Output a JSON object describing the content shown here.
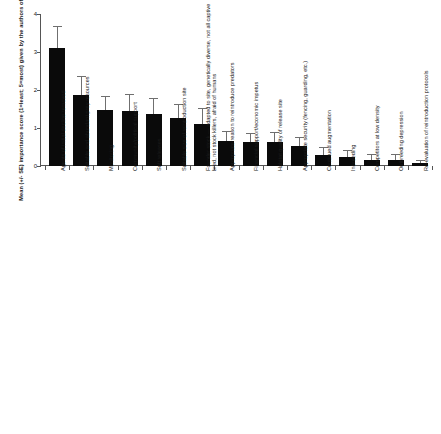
{
  "chart_data": {
    "type": "bar",
    "title": "",
    "xlabel": "",
    "ylabel": "Mean (+/- SE) importance score (1=least; 5=most) given by the authors of this book",
    "ylim": [
      0,
      4
    ],
    "yticks": [
      0,
      1,
      2,
      3,
      4
    ],
    "ytick_labels": [
      "0",
      "1",
      "2",
      "3",
      "4"
    ],
    "grid": false,
    "legend": "none",
    "error_type": "SE",
    "categories": [
      "Agents of initial decline removed",
      "Suitable and abundant prey resources",
      "Monitoring",
      "Community/political support",
      "Soft releases",
      "Suitable size of reintroduction site",
      "Founder stock — adapted to site, genetically diverse, not all captive bred, not stock killers, afraid of humans",
      "Appropriate reason to reintroduce predators",
      "Financial support/economic impetus",
      "Habitat quality of release site",
      "Appropriate security (fencing, guarding, etc.)",
      "Continued augmentation",
      "Inbreeding",
      "Competitors at low density",
      "Outbreeding depression",
      "Re-evaluation of reintroduction protocols"
    ],
    "category_lines": [
      [
        "Agents of initial decline removed"
      ],
      [
        "Suitable and abundant prey resources"
      ],
      [
        "Monitoring"
      ],
      [
        "Community/political support"
      ],
      [
        "Soft releases"
      ],
      [
        "Suitable size of reintroduction site"
      ],
      [
        "Founder stock — adapted to site, genetically diverse, not all captive",
        "bred, not stock killers, afraid of humans"
      ],
      [
        "Appropriate reason to reintroduce predators"
      ],
      [
        "Financial support/economic impetus"
      ],
      [
        "Habitat quality of release site"
      ],
      [
        "Appropriate security (fencing, guarding, etc.)"
      ],
      [
        "Continued augmentation"
      ],
      [
        "Inbreeding"
      ],
      [
        "Competitors at low density"
      ],
      [
        "Outbreeding depression"
      ],
      [
        "Re-evaluation of reintroduction protocols"
      ]
    ],
    "values": [
      3.1,
      1.87,
      1.47,
      1.44,
      1.38,
      1.26,
      1.11,
      0.66,
      0.63,
      0.64,
      0.52,
      0.3,
      0.25,
      0.17,
      0.17,
      0.07
    ],
    "errors": [
      0.55,
      0.48,
      0.35,
      0.42,
      0.38,
      0.35,
      0.39,
      0.24,
      0.22,
      0.23,
      0.23,
      0.17,
      0.14,
      0.12,
      0.13,
      0.07
    ],
    "bar_color": "#0a0a0a",
    "error_color": "#6f6f6f",
    "axis_color": "#555555",
    "background": "#ffffff"
  }
}
